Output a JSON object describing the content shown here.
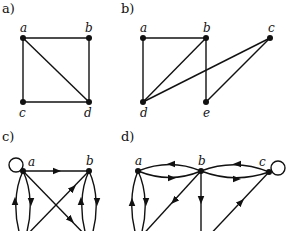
{
  "panels": [
    {
      "id": "a",
      "label": "a)",
      "nodes": [
        "a",
        "b",
        "c",
        "d"
      ],
      "edges": [
        [
          "a",
          "b"
        ],
        [
          "a",
          "c"
        ],
        [
          "a",
          "d"
        ],
        [
          "b",
          "d"
        ],
        [
          "c",
          "d"
        ]
      ],
      "directed": false
    },
    {
      "id": "b",
      "label": "b)",
      "nodes": [
        "a",
        "b",
        "c",
        "d",
        "e"
      ],
      "edges": [
        [
          "a",
          "b"
        ],
        [
          "a",
          "d"
        ],
        [
          "b",
          "d"
        ],
        [
          "b",
          "e"
        ],
        [
          "c",
          "d"
        ],
        [
          "c",
          "e"
        ]
      ],
      "directed": false
    },
    {
      "id": "c",
      "label": "c)",
      "nodes": [
        "a",
        "b"
      ],
      "edges": [
        [
          "a",
          "a"
        ],
        [
          "a",
          "b"
        ],
        [
          "a",
          "c"
        ],
        [
          "c",
          "a"
        ],
        [
          "a",
          "d"
        ],
        [
          "c",
          "b"
        ],
        [
          "b",
          "d"
        ],
        [
          "d",
          "b"
        ]
      ],
      "directed": true
    },
    {
      "id": "d",
      "label": "d)",
      "nodes": [
        "a",
        "b",
        "c"
      ],
      "edges": [
        [
          "b",
          "a"
        ],
        [
          "a",
          "b"
        ],
        [
          "c",
          "b"
        ],
        [
          "b",
          "c"
        ],
        [
          "c",
          "c"
        ],
        [
          "a",
          "d"
        ],
        [
          "d",
          "a"
        ],
        [
          "e",
          "b"
        ],
        [
          "b",
          "e"
        ],
        [
          "f",
          "c"
        ]
      ],
      "directed": true
    }
  ],
  "node_labels": {
    "a_a": "a",
    "a_b": "b",
    "a_c": "c",
    "a_d": "d",
    "b_a": "a",
    "b_b": "b",
    "b_c": "c",
    "b_d": "d",
    "b_e": "e",
    "c_a": "a",
    "c_b": "b",
    "d_a": "a",
    "d_b": "b",
    "d_c": "c"
  },
  "panel_labels": {
    "a": "a)",
    "b": "b)",
    "c": "c)",
    "d": "d)"
  }
}
